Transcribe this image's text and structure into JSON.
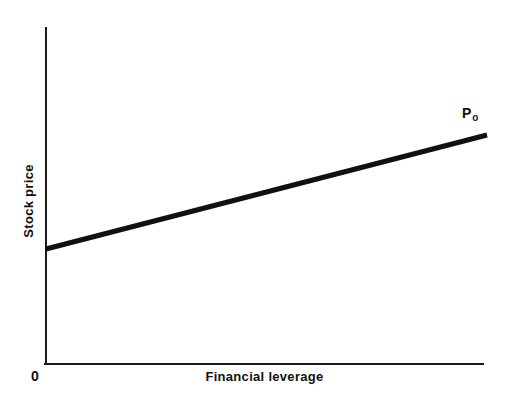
{
  "figure": {
    "background_color": "#ffffff",
    "width": 509,
    "height": 402
  },
  "labels": {
    "y_axis_title": "Stock price",
    "x_axis_title": "Financial leverage",
    "origin": "0",
    "curve_label_base": "P",
    "curve_label_subscript": "o"
  },
  "chart_data": {
    "type": "line",
    "title": "",
    "subtitle": "",
    "xlabel": "Financial leverage",
    "ylabel": "Stock price",
    "grid": false,
    "legend": "none",
    "axis_style": "open (left and bottom spines only, no tick marks, no tick labels)",
    "xlim": [
      0,
      1
    ],
    "ylim": [
      0,
      1
    ],
    "x_tick_labels": [
      "0"
    ],
    "y_tick_labels": [],
    "series": [
      {
        "name": "P",
        "label": "Po",
        "color": "#111111",
        "line_width_px": 5,
        "x": [
          0.0,
          1.0
        ],
        "y": [
          0.342,
          0.682
        ],
        "description": "Stock price increases linearly with financial leverage"
      }
    ],
    "annotations": [
      {
        "text": "Po",
        "x": 1.0,
        "y": 0.682,
        "position": "above-right of line endpoint"
      },
      {
        "text": "0",
        "x": 0.0,
        "y": 0.0,
        "position": "below-left of axis origin"
      }
    ]
  },
  "geometry": {
    "axis_color": "#1a1a1a",
    "axis_width_px": 2,
    "y_axis": {
      "x": 46,
      "y_top": 28,
      "y_bottom": 364
    },
    "x_axis": {
      "y": 364,
      "x_left": 46,
      "x_right": 483
    },
    "line_px": {
      "x1": 46,
      "y1": 249,
      "x2": 487,
      "y2": 135
    }
  }
}
